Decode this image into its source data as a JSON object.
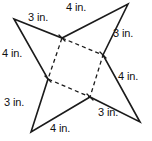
{
  "figure": {
    "name": "four-pointed-star-with-inner-square",
    "unit": "in.",
    "stroke_color": "#1b1b1b",
    "background_color": "#ffffff",
    "labels": [
      {
        "id": "top-left-upper",
        "text": "3 in.",
        "value": 3,
        "unit": "in.",
        "x": 28,
        "y": 12
      },
      {
        "id": "top-right-upper",
        "text": "4 in.",
        "value": 4,
        "unit": "in.",
        "x": 66,
        "y": 2
      },
      {
        "id": "right-upper",
        "text": "3 in.",
        "value": 3,
        "unit": "in.",
        "x": 113,
        "y": 28
      },
      {
        "id": "left-upper",
        "text": "4 in.",
        "value": 4,
        "unit": "in.",
        "x": 2,
        "y": 48
      },
      {
        "id": "right-lower",
        "text": "4 in.",
        "value": 4,
        "unit": "in.",
        "x": 118,
        "y": 71
      },
      {
        "id": "left-lower",
        "text": "3 in.",
        "value": 3,
        "unit": "in.",
        "x": 4,
        "y": 97
      },
      {
        "id": "bottom-right-lower",
        "text": "3 in.",
        "value": 3,
        "unit": "in.",
        "x": 98,
        "y": 107
      },
      {
        "id": "bottom-left-lower",
        "text": "4 in.",
        "value": 4,
        "unit": "in.",
        "x": 50,
        "y": 123
      }
    ],
    "geometry": {
      "star_points": [
        {
          "id": "tip-top-left",
          "x": 14,
          "y": 19
        },
        {
          "id": "vertex-top",
          "x": 62,
          "y": 38
        },
        {
          "id": "tip-top-right",
          "x": 128,
          "y": 4
        },
        {
          "id": "vertex-right",
          "x": 103,
          "y": 55
        },
        {
          "id": "tip-bottom-right",
          "x": 140,
          "y": 122
        },
        {
          "id": "vertex-bottom",
          "x": 90,
          "y": 97
        },
        {
          "id": "tip-bottom-left",
          "x": 31,
          "y": 132
        },
        {
          "id": "vertex-left",
          "x": 48,
          "y": 79
        }
      ],
      "inner_square": [
        {
          "id": "corner-top",
          "x": 62,
          "y": 38
        },
        {
          "id": "corner-right",
          "x": 103,
          "y": 55
        },
        {
          "id": "corner-bottom",
          "x": 90,
          "y": 97
        },
        {
          "id": "corner-left",
          "x": 48,
          "y": 79
        }
      ]
    }
  }
}
